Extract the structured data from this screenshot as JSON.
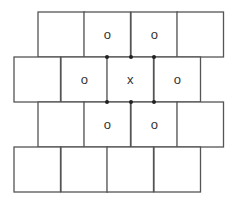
{
  "diagram": {
    "colors": {
      "line": "#555555",
      "text": "#333333",
      "dot": "#222222",
      "background": "#ffffff"
    },
    "rows": [
      {
        "y": 12,
        "cells": [
          {
            "x": 38,
            "label": ""
          },
          {
            "x": 84,
            "label": "o"
          },
          {
            "x": 131,
            "label": "o"
          },
          {
            "x": 177,
            "label": ""
          }
        ]
      },
      {
        "y": 57,
        "cells": [
          {
            "x": 14,
            "label": ""
          },
          {
            "x": 61,
            "label": "o"
          },
          {
            "x": 107,
            "label": "x"
          },
          {
            "x": 154,
            "label": "o"
          }
        ]
      },
      {
        "y": 102,
        "cells": [
          {
            "x": 38,
            "label": ""
          },
          {
            "x": 84,
            "label": "o"
          },
          {
            "x": 131,
            "label": "o"
          },
          {
            "x": 177,
            "label": ""
          }
        ]
      },
      {
        "y": 147,
        "cells": [
          {
            "x": 14,
            "label": ""
          },
          {
            "x": 61,
            "label": ""
          },
          {
            "x": 107,
            "label": ""
          },
          {
            "x": 154,
            "label": ""
          }
        ]
      }
    ],
    "cell_width": 46.5,
    "cell_height": 45,
    "dots": [
      {
        "x": 107,
        "y": 57
      },
      {
        "x": 131,
        "y": 57
      },
      {
        "x": 154,
        "y": 57
      },
      {
        "x": 107,
        "y": 102
      },
      {
        "x": 131,
        "y": 102
      },
      {
        "x": 154,
        "y": 102
      }
    ]
  }
}
